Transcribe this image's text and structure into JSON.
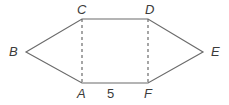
{
  "figure": {
    "kind": "geometry-diagram",
    "shape_name": "hexagon",
    "background_color": "#ffffff",
    "stroke_color": "#6b6b6b",
    "label_color": "#3b3b3b",
    "stroke_width": 1.2,
    "dash_pattern": "3 3",
    "vertices": [
      {
        "id": "B",
        "label": "B",
        "x": 26,
        "y": 52
      },
      {
        "id": "C",
        "label": "C",
        "x": 82,
        "y": 19
      },
      {
        "id": "D",
        "label": "D",
        "x": 148,
        "y": 19
      },
      {
        "id": "E",
        "label": "E",
        "x": 203,
        "y": 52
      },
      {
        "id": "F",
        "label": "F",
        "x": 148,
        "y": 83
      },
      {
        "id": "A",
        "label": "A",
        "x": 82,
        "y": 83
      }
    ],
    "outline_points": "26,52 82,19 148,19 203,52 148,83 82,83",
    "dashed_segments": [
      {
        "id": "CA",
        "from": "C",
        "to": "A",
        "x1": 82,
        "y1": 19,
        "x2": 82,
        "y2": 83
      },
      {
        "id": "DF",
        "from": "D",
        "to": "F",
        "x1": 148,
        "y1": 19,
        "x2": 148,
        "y2": 83
      }
    ],
    "measures": [
      {
        "id": "AF",
        "on_segment": "AF",
        "value": "5"
      }
    ]
  }
}
